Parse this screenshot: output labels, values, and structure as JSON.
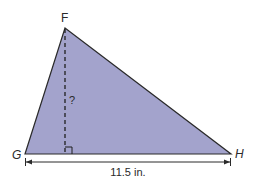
{
  "diagram": {
    "type": "triangle",
    "fill_color": "#a3a3cc",
    "stroke_color": "#2a2a2a",
    "vertices": {
      "F": {
        "label": "F",
        "x": 65,
        "y": 28
      },
      "G": {
        "label": "G",
        "x": 25,
        "y": 154
      },
      "H": {
        "label": "H",
        "x": 231,
        "y": 154
      }
    },
    "altitude": {
      "label": "?",
      "style": "dashed",
      "right_angle_marker": true
    },
    "base_dimension": {
      "label": "11.5 in."
    }
  }
}
